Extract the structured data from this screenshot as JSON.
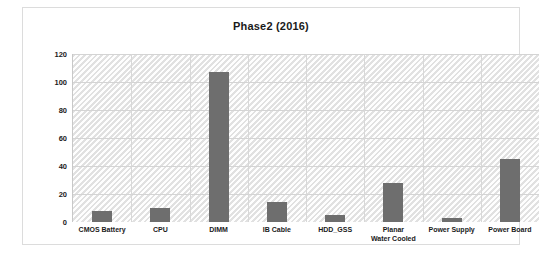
{
  "chart_data": {
    "type": "bar",
    "title": "Phase2 (2016)",
    "xlabel": "",
    "ylabel": "",
    "ylim": [
      0,
      120
    ],
    "ytick_labels": [
      "120",
      "100",
      "80",
      "60",
      "40",
      "20",
      "0"
    ],
    "yticks": [
      120,
      100,
      80,
      60,
      40,
      20,
      0
    ],
    "grid": true,
    "legend": "none",
    "bar_color": "#6e6e6e",
    "plot_background": "#f2f2f2",
    "categories": [
      "CMOS Battery",
      "CPU",
      "DIMM",
      "IB Cable",
      "HDD_GSS",
      "Planar Water Cooled",
      "Power Supply",
      "Power Board"
    ],
    "category_label_lines": [
      [
        "CMOS Battery"
      ],
      [
        "CPU"
      ],
      [
        "DIMM"
      ],
      [
        "IB Cable"
      ],
      [
        "HDD_GSS"
      ],
      [
        "Planar",
        "Water Cooled"
      ],
      [
        "Power Supply"
      ],
      [
        "Power Board"
      ]
    ],
    "values": [
      8,
      10,
      107,
      14,
      5,
      28,
      3,
      45
    ]
  }
}
